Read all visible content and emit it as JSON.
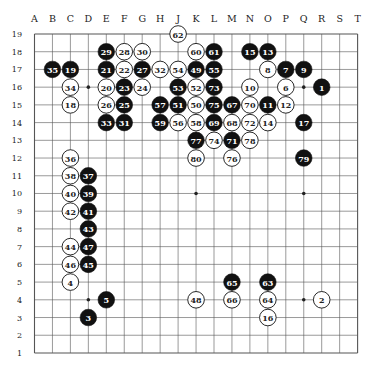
{
  "board": {
    "size": 19,
    "columns": [
      "A",
      "B",
      "C",
      "D",
      "E",
      "F",
      "G",
      "H",
      "J",
      "K",
      "L",
      "M",
      "N",
      "O",
      "P",
      "Q",
      "R",
      "S",
      "T"
    ],
    "rows": [
      19,
      18,
      17,
      16,
      15,
      14,
      13,
      12,
      11,
      10,
      9,
      8,
      7,
      6,
      5,
      4,
      3,
      2,
      1
    ],
    "star_points": [
      "D4",
      "D10",
      "D16",
      "K4",
      "K10",
      "K16",
      "Q4",
      "Q10",
      "Q16"
    ],
    "colors": {
      "line": "#555555",
      "black_stone": "#111111",
      "white_stone": "#ffffff",
      "background": "#ffffff"
    }
  },
  "stones": [
    {
      "n": "1",
      "color": "black",
      "pos": "R16"
    },
    {
      "n": "2",
      "color": "white",
      "pos": "R4"
    },
    {
      "n": "3",
      "color": "black",
      "pos": "D3"
    },
    {
      "n": "4",
      "color": "white",
      "pos": "C5"
    },
    {
      "n": "5",
      "color": "black",
      "pos": "E4"
    },
    {
      "n": "6",
      "color": "white",
      "pos": "P16"
    },
    {
      "n": "7",
      "color": "black",
      "pos": "P17"
    },
    {
      "n": "8",
      "color": "white",
      "pos": "O17"
    },
    {
      "n": "9",
      "color": "black",
      "pos": "Q17"
    },
    {
      "n": "10",
      "color": "white",
      "pos": "N16"
    },
    {
      "n": "11",
      "color": "black",
      "pos": "O15"
    },
    {
      "n": "12",
      "color": "white",
      "pos": "P15"
    },
    {
      "n": "13",
      "color": "black",
      "pos": "O18"
    },
    {
      "n": "14",
      "color": "white",
      "pos": "O14"
    },
    {
      "n": "15",
      "color": "black",
      "pos": "N18"
    },
    {
      "n": "16",
      "color": "white",
      "pos": "O3"
    },
    {
      "n": "17",
      "color": "black",
      "pos": "Q14"
    },
    {
      "n": "18",
      "color": "white",
      "pos": "C15"
    },
    {
      "n": "19",
      "color": "black",
      "pos": "C17"
    },
    {
      "n": "20",
      "color": "white",
      "pos": "E16"
    },
    {
      "n": "21",
      "color": "black",
      "pos": "E17"
    },
    {
      "n": "22",
      "color": "white",
      "pos": "F17"
    },
    {
      "n": "23",
      "color": "black",
      "pos": "F16"
    },
    {
      "n": "24",
      "color": "white",
      "pos": "G16"
    },
    {
      "n": "25",
      "color": "black",
      "pos": "F15"
    },
    {
      "n": "26",
      "color": "white",
      "pos": "E15"
    },
    {
      "n": "27",
      "color": "black",
      "pos": "G17"
    },
    {
      "n": "28",
      "color": "white",
      "pos": "F18"
    },
    {
      "n": "29",
      "color": "black",
      "pos": "E18"
    },
    {
      "n": "30",
      "color": "white",
      "pos": "G18"
    },
    {
      "n": "31",
      "color": "black",
      "pos": "F14"
    },
    {
      "n": "32",
      "color": "white",
      "pos": "H17"
    },
    {
      "n": "33",
      "color": "black",
      "pos": "E14"
    },
    {
      "n": "34",
      "color": "white",
      "pos": "C16"
    },
    {
      "n": "35",
      "color": "black",
      "pos": "B17"
    },
    {
      "n": "36",
      "color": "white",
      "pos": "C12"
    },
    {
      "n": "37",
      "color": "black",
      "pos": "D11"
    },
    {
      "n": "38",
      "color": "white",
      "pos": "C11"
    },
    {
      "n": "39",
      "color": "black",
      "pos": "D10"
    },
    {
      "n": "40",
      "color": "white",
      "pos": "C10"
    },
    {
      "n": "41",
      "color": "black",
      "pos": "D9"
    },
    {
      "n": "42",
      "color": "white",
      "pos": "C9"
    },
    {
      "n": "43",
      "color": "black",
      "pos": "D8"
    },
    {
      "n": "44",
      "color": "white",
      "pos": "C7"
    },
    {
      "n": "45",
      "color": "black",
      "pos": "D6"
    },
    {
      "n": "46",
      "color": "white",
      "pos": "C6"
    },
    {
      "n": "47",
      "color": "black",
      "pos": "D7"
    },
    {
      "n": "48",
      "color": "white",
      "pos": "K4"
    },
    {
      "n": "49",
      "color": "black",
      "pos": "K17"
    },
    {
      "n": "50",
      "color": "white",
      "pos": "K15"
    },
    {
      "n": "51",
      "color": "black",
      "pos": "J15"
    },
    {
      "n": "52",
      "color": "white",
      "pos": "K16"
    },
    {
      "n": "53",
      "color": "black",
      "pos": "J16"
    },
    {
      "n": "54",
      "color": "white",
      "pos": "J17"
    },
    {
      "n": "55",
      "color": "black",
      "pos": "L17"
    },
    {
      "n": "56",
      "color": "white",
      "pos": "J14"
    },
    {
      "n": "57",
      "color": "black",
      "pos": "H15"
    },
    {
      "n": "58",
      "color": "white",
      "pos": "K14"
    },
    {
      "n": "59",
      "color": "black",
      "pos": "H14"
    },
    {
      "n": "60",
      "color": "white",
      "pos": "K18"
    },
    {
      "n": "61",
      "color": "black",
      "pos": "L18"
    },
    {
      "n": "62",
      "color": "white",
      "pos": "J19"
    },
    {
      "n": "63",
      "color": "black",
      "pos": "O5"
    },
    {
      "n": "64",
      "color": "white",
      "pos": "O4"
    },
    {
      "n": "65",
      "color": "black",
      "pos": "M5"
    },
    {
      "n": "66",
      "color": "white",
      "pos": "M4"
    },
    {
      "n": "67",
      "color": "black",
      "pos": "M15"
    },
    {
      "n": "68",
      "color": "white",
      "pos": "M14"
    },
    {
      "n": "69",
      "color": "black",
      "pos": "L14"
    },
    {
      "n": "70",
      "color": "white",
      "pos": "N15"
    },
    {
      "n": "71",
      "color": "black",
      "pos": "M13"
    },
    {
      "n": "72",
      "color": "white",
      "pos": "N14"
    },
    {
      "n": "73",
      "color": "black",
      "pos": "L16"
    },
    {
      "n": "74",
      "color": "white",
      "pos": "L13"
    },
    {
      "n": "75",
      "color": "black",
      "pos": "L15"
    },
    {
      "n": "76",
      "color": "white",
      "pos": "M12"
    },
    {
      "n": "77",
      "color": "black",
      "pos": "K13"
    },
    {
      "n": "78",
      "color": "white",
      "pos": "N13"
    },
    {
      "n": "79",
      "color": "black",
      "pos": "Q12"
    },
    {
      "n": "80",
      "color": "white",
      "pos": "K12"
    }
  ]
}
